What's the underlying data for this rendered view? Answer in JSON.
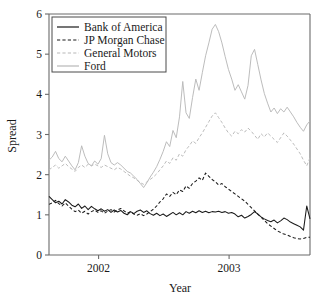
{
  "chart_data": {
    "type": "line",
    "title": "",
    "xlabel": "Year",
    "ylabel": "Spread",
    "xlim": [
      2001.62,
      2003.62
    ],
    "ylim": [
      0,
      6
    ],
    "xticks": [
      2002,
      2003
    ],
    "xtick_labels": [
      "2002",
      "2003"
    ],
    "yticks": [
      0,
      1,
      2,
      3,
      4,
      5,
      6
    ],
    "ytick_labels": [
      "0",
      "1",
      "2",
      "3",
      "4",
      "5",
      "6"
    ],
    "grid": false,
    "legend_position": "top-left",
    "colors": {
      "bank_of_america": "#1a1a1a",
      "jp_morgan_chase": "#1a1a1a",
      "general_motors": "#b8b8b8",
      "ford": "#b8b8b8",
      "axis": "#6b6b6b",
      "background": "#ffffff"
    },
    "series": [
      {
        "name": "Bank of America",
        "style": "solid",
        "color": "#1a1a1a",
        "x": [
          2001.62,
          2001.645,
          2001.67,
          2001.695,
          2001.72,
          2001.745,
          2001.77,
          2001.795,
          2001.82,
          2001.845,
          2001.87,
          2001.895,
          2001.92,
          2001.945,
          2001.97,
          2001.995,
          2002.02,
          2002.045,
          2002.07,
          2002.095,
          2002.12,
          2002.145,
          2002.17,
          2002.195,
          2002.22,
          2002.245,
          2002.27,
          2002.295,
          2002.32,
          2002.345,
          2002.37,
          2002.395,
          2002.42,
          2002.445,
          2002.47,
          2002.495,
          2002.52,
          2002.545,
          2002.57,
          2002.595,
          2002.62,
          2002.645,
          2002.67,
          2002.695,
          2002.72,
          2002.745,
          2002.77,
          2002.795,
          2002.82,
          2002.845,
          2002.87,
          2002.895,
          2002.92,
          2002.945,
          2002.97,
          2002.995,
          2003.02,
          2003.045,
          2003.07,
          2003.095,
          2003.12,
          2003.145,
          2003.17,
          2003.195,
          2003.22,
          2003.245,
          2003.27,
          2003.295,
          2003.32,
          2003.345,
          2003.37,
          2003.395,
          2003.42,
          2003.445,
          2003.47,
          2003.495,
          2003.52,
          2003.545,
          2003.57,
          2003.595,
          2003.62
        ],
        "values": [
          1.46,
          1.38,
          1.3,
          1.34,
          1.27,
          1.38,
          1.32,
          1.24,
          1.2,
          1.27,
          1.16,
          1.22,
          1.13,
          1.21,
          1.15,
          1.1,
          1.15,
          1.09,
          1.13,
          1.06,
          1.12,
          1.07,
          1.11,
          1.04,
          1.0,
          1.08,
          1.03,
          1.09,
          1.12,
          1.06,
          1.1,
          1.03,
          0.99,
          1.04,
          0.98,
          1.02,
          0.96,
          1.01,
          1.06,
          1.0,
          1.05,
          1.0,
          1.08,
          1.04,
          1.09,
          1.05,
          1.1,
          1.06,
          1.09,
          1.05,
          1.08,
          1.07,
          1.09,
          1.06,
          1.08,
          1.04,
          1.06,
          1.02,
          0.95,
          0.99,
          0.92,
          0.96,
          1.01,
          1.08,
          1.02,
          0.95,
          0.9,
          0.86,
          0.83,
          0.87,
          0.8,
          0.85,
          0.92,
          0.88,
          0.82,
          0.78,
          0.74,
          0.7,
          0.62,
          1.22,
          0.9
        ]
      },
      {
        "name": "JP Morgan Chase",
        "style": "dashed",
        "color": "#1a1a1a",
        "x": [
          2001.62,
          2001.645,
          2001.67,
          2001.695,
          2001.72,
          2001.745,
          2001.77,
          2001.795,
          2001.82,
          2001.845,
          2001.87,
          2001.895,
          2001.92,
          2001.945,
          2001.97,
          2001.995,
          2002.02,
          2002.045,
          2002.07,
          2002.095,
          2002.12,
          2002.145,
          2002.17,
          2002.195,
          2002.22,
          2002.245,
          2002.27,
          2002.295,
          2002.32,
          2002.345,
          2002.37,
          2002.395,
          2002.42,
          2002.445,
          2002.47,
          2002.495,
          2002.52,
          2002.545,
          2002.57,
          2002.595,
          2002.62,
          2002.645,
          2002.67,
          2002.695,
          2002.72,
          2002.745,
          2002.77,
          2002.795,
          2002.82,
          2002.845,
          2002.87,
          2002.895,
          2002.92,
          2002.945,
          2002.97,
          2002.995,
          2003.02,
          2003.045,
          2003.07,
          2003.095,
          2003.12,
          2003.145,
          2003.17,
          2003.195,
          2003.22,
          2003.245,
          2003.27,
          2003.295,
          2003.32,
          2003.345,
          2003.37,
          2003.395,
          2003.42,
          2003.445,
          2003.47,
          2003.495,
          2003.52,
          2003.545,
          2003.57,
          2003.595,
          2003.62
        ],
        "values": [
          1.26,
          1.3,
          1.36,
          1.28,
          1.22,
          1.3,
          1.22,
          1.14,
          1.08,
          1.12,
          1.04,
          1.09,
          1.02,
          1.08,
          1.12,
          1.06,
          1.1,
          1.04,
          1.09,
          1.13,
          1.07,
          1.12,
          1.16,
          1.1,
          1.04,
          1.08,
          1.02,
          0.99,
          1.03,
          0.98,
          1.02,
          1.08,
          1.14,
          1.22,
          1.32,
          1.4,
          1.52,
          1.46,
          1.56,
          1.5,
          1.62,
          1.58,
          1.72,
          1.66,
          1.78,
          1.84,
          1.92,
          1.86,
          2.04,
          1.96,
          1.88,
          1.82,
          1.74,
          1.78,
          1.7,
          1.64,
          1.58,
          1.52,
          1.46,
          1.4,
          1.34,
          1.26,
          1.18,
          1.1,
          1.02,
          0.94,
          0.86,
          0.78,
          0.72,
          0.66,
          0.6,
          0.56,
          0.52,
          0.5,
          0.46,
          0.43,
          0.41,
          0.4,
          0.41,
          0.44,
          0.44
        ]
      },
      {
        "name": "General Motors",
        "style": "dashed",
        "color": "#b8b8b8",
        "x": [
          2001.62,
          2001.645,
          2001.67,
          2001.695,
          2001.72,
          2001.745,
          2001.77,
          2001.795,
          2001.82,
          2001.845,
          2001.87,
          2001.895,
          2001.92,
          2001.945,
          2001.97,
          2001.995,
          2002.02,
          2002.045,
          2002.07,
          2002.095,
          2002.12,
          2002.145,
          2002.17,
          2002.195,
          2002.22,
          2002.245,
          2002.27,
          2002.295,
          2002.32,
          2002.345,
          2002.37,
          2002.395,
          2002.42,
          2002.445,
          2002.47,
          2002.495,
          2002.52,
          2002.545,
          2002.57,
          2002.595,
          2002.62,
          2002.645,
          2002.67,
          2002.695,
          2002.72,
          2002.745,
          2002.77,
          2002.795,
          2002.82,
          2002.845,
          2002.87,
          2002.895,
          2002.92,
          2002.945,
          2002.97,
          2002.995,
          2003.02,
          2003.045,
          2003.07,
          2003.095,
          2003.12,
          2003.145,
          2003.17,
          2003.195,
          2003.22,
          2003.245,
          2003.27,
          2003.295,
          2003.32,
          2003.345,
          2003.37,
          2003.395,
          2003.42,
          2003.445,
          2003.47,
          2003.495,
          2003.52,
          2003.545,
          2003.57,
          2003.595,
          2003.62
        ],
        "values": [
          2.12,
          2.18,
          2.24,
          2.16,
          2.22,
          2.28,
          2.2,
          2.14,
          2.08,
          2.18,
          2.24,
          2.18,
          2.26,
          2.22,
          2.26,
          2.22,
          2.18,
          2.24,
          2.2,
          2.16,
          2.12,
          2.18,
          2.14,
          2.08,
          2.02,
          1.96,
          1.92,
          1.86,
          1.8,
          1.76,
          1.82,
          1.88,
          1.94,
          2.02,
          2.12,
          2.22,
          2.34,
          2.28,
          2.42,
          2.36,
          2.52,
          2.46,
          2.62,
          2.72,
          2.84,
          2.78,
          2.92,
          3.04,
          3.18,
          3.32,
          3.46,
          3.54,
          3.42,
          3.3,
          3.16,
          3.04,
          2.96,
          3.08,
          3.02,
          3.12,
          3.06,
          3.16,
          3.08,
          2.98,
          2.88,
          3.02,
          2.94,
          3.04,
          2.96,
          2.88,
          2.8,
          2.92,
          3.04,
          2.96,
          2.86,
          2.76,
          2.64,
          2.52,
          2.36,
          2.22,
          2.42
        ]
      },
      {
        "name": "Ford",
        "style": "solid",
        "color": "#b8b8b8",
        "x": [
          2001.62,
          2001.645,
          2001.67,
          2001.695,
          2001.72,
          2001.745,
          2001.77,
          2001.795,
          2001.82,
          2001.845,
          2001.87,
          2001.895,
          2001.92,
          2001.945,
          2001.97,
          2001.995,
          2002.02,
          2002.045,
          2002.07,
          2002.095,
          2002.12,
          2002.145,
          2002.17,
          2002.195,
          2002.22,
          2002.245,
          2002.27,
          2002.295,
          2002.32,
          2002.345,
          2002.37,
          2002.395,
          2002.42,
          2002.445,
          2002.47,
          2002.495,
          2002.52,
          2002.545,
          2002.57,
          2002.595,
          2002.62,
          2002.645,
          2002.67,
          2002.695,
          2002.72,
          2002.745,
          2002.77,
          2002.795,
          2002.82,
          2002.845,
          2002.87,
          2002.895,
          2002.92,
          2002.945,
          2002.97,
          2002.995,
          2003.02,
          2003.045,
          2003.07,
          2003.095,
          2003.12,
          2003.145,
          2003.17,
          2003.195,
          2003.22,
          2003.245,
          2003.27,
          2003.295,
          2003.32,
          2003.345,
          2003.37,
          2003.395,
          2003.42,
          2003.445,
          2003.47,
          2003.495,
          2003.52,
          2003.545,
          2003.57,
          2003.595,
          2003.62
        ],
        "values": [
          2.36,
          2.44,
          2.58,
          2.4,
          2.32,
          2.46,
          2.34,
          2.22,
          2.12,
          2.3,
          2.72,
          2.46,
          2.28,
          2.22,
          2.34,
          2.26,
          2.4,
          2.98,
          2.52,
          2.3,
          2.24,
          2.3,
          2.24,
          2.16,
          2.08,
          2.04,
          1.96,
          1.88,
          1.78,
          1.68,
          1.8,
          1.94,
          2.06,
          2.2,
          2.38,
          2.58,
          2.82,
          2.7,
          3.1,
          2.92,
          3.44,
          4.32,
          3.54,
          3.4,
          3.92,
          4.38,
          4.1,
          4.54,
          4.96,
          5.28,
          5.62,
          5.74,
          5.56,
          5.28,
          4.94,
          4.62,
          4.38,
          4.1,
          4.24,
          4.06,
          3.88,
          4.22,
          4.96,
          5.12,
          4.74,
          4.36,
          4.02,
          3.78,
          3.56,
          3.66,
          3.52,
          3.64,
          3.56,
          3.68,
          3.56,
          3.44,
          3.3,
          3.18,
          3.08,
          3.24,
          3.34
        ]
      }
    ]
  },
  "legend": {
    "entries": [
      {
        "label": "Bank of America",
        "style": "solid",
        "color": "#1a1a1a"
      },
      {
        "label": "JP Morgan Chase",
        "style": "dashed",
        "color": "#1a1a1a"
      },
      {
        "label": "General Motors",
        "style": "dashed",
        "color": "#b8b8b8"
      },
      {
        "label": "Ford",
        "style": "solid",
        "color": "#b8b8b8"
      }
    ]
  }
}
